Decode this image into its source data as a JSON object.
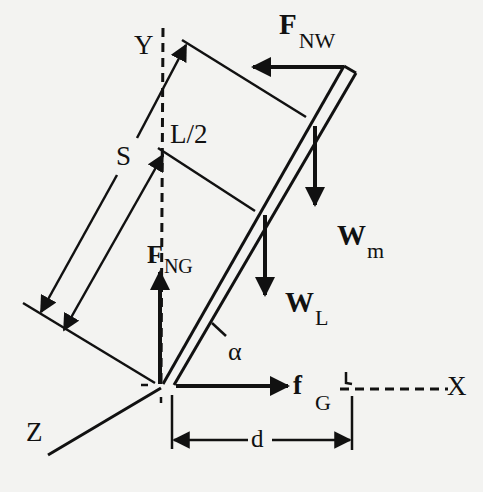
{
  "diagram": {
    "type": "free-body diagram",
    "colors": {
      "ink": "#111111",
      "background": "#f3f3f1"
    },
    "axes": {
      "y_label": "Y",
      "x_label": "X",
      "z_label": "Z"
    },
    "dimensions": {
      "s_label": "S",
      "half_length_label": "L/2",
      "d_label": "d",
      "angle_label": "α"
    },
    "forces": {
      "wall_normal": {
        "main": "F",
        "sub": "NW"
      },
      "ground_normal": {
        "main": "F",
        "sub": "NG"
      },
      "ground_friction": {
        "main": "f",
        "sub": "G"
      },
      "mass_weight": {
        "main": "W",
        "sub": "m"
      },
      "ladder_weight": {
        "main": "W",
        "sub": "L"
      }
    }
  }
}
